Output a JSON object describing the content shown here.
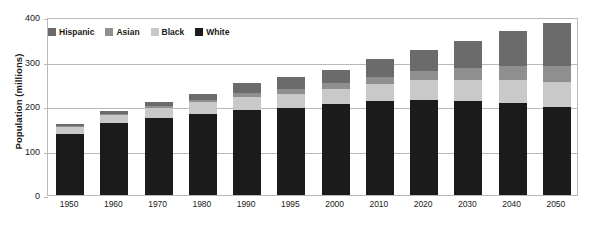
{
  "chart_data": {
    "type": "bar",
    "stacked": true,
    "title": "",
    "xlabel": "",
    "ylabel": "Population (millions)",
    "ylim": [
      0,
      400
    ],
    "yticks": [
      0,
      100,
      200,
      300,
      400
    ],
    "grid": true,
    "legend_position": "top-left",
    "categories": [
      "1950",
      "1960",
      "1970",
      "1980",
      "1990",
      "1995",
      "2000",
      "2010",
      "2020",
      "2030",
      "2040",
      "2050"
    ],
    "series": [
      {
        "name": "White",
        "color": "#1b1b1b",
        "values": [
          138,
          161,
          172,
          181,
          191,
          196,
          205,
          211,
          214,
          211,
          207,
          198
        ]
      },
      {
        "name": "Black",
        "color": "#c9c9c9",
        "values": [
          15,
          19,
          23,
          27,
          30,
          32,
          34,
          39,
          44,
          48,
          52,
          56
        ]
      },
      {
        "name": "Asian",
        "color": "#8f8f8f",
        "values": [
          2,
          3,
          4,
          5,
          8,
          10,
          12,
          16,
          21,
          26,
          31,
          36
        ]
      },
      {
        "name": "Hispanic",
        "color": "#6b6b6b",
        "values": [
          4,
          6,
          9,
          15,
          22,
          27,
          31,
          40,
          48,
          62,
          78,
          96
        ]
      }
    ],
    "totals": [
      159,
      189,
      208,
      228,
      251,
      265,
      282,
      306,
      327,
      347,
      368,
      386
    ]
  },
  "axes": {
    "y_title": "Population (millions)",
    "y_tick_labels": [
      "400",
      "300",
      "200",
      "100",
      "0"
    ],
    "x_tick_labels": [
      "1950",
      "1960",
      "1970",
      "1980",
      "1990",
      "1995",
      "2000",
      "2010",
      "2020",
      "2030",
      "2040",
      "2050"
    ]
  },
  "legend": {
    "items": [
      {
        "label": "Hispanic",
        "color": "#6b6b6b"
      },
      {
        "label": "Asian",
        "color": "#8f8f8f"
      },
      {
        "label": "Black",
        "color": "#c9c9c9"
      },
      {
        "label": "White",
        "color": "#1b1b1b"
      }
    ]
  },
  "colors": {
    "plot_border": "#b9b9b9",
    "gridline": "#b9b9b9",
    "background": "#ffffff",
    "text": "#1a1a1a"
  }
}
